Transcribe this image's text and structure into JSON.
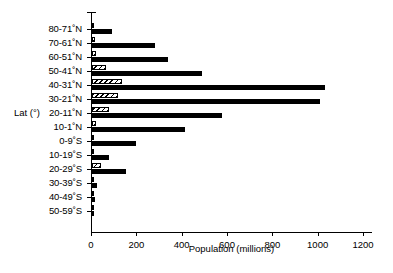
{
  "chart_data": {
    "type": "bar",
    "orientation": "horizontal",
    "title": "",
    "xlabel": "Population (millions)",
    "ylabel": "Lat (°)",
    "xlim": [
      0,
      1200
    ],
    "xticks": [
      0,
      200,
      400,
      600,
      800,
      1000,
      1200
    ],
    "xticklabels": [
      "0",
      "200",
      "400",
      "600",
      "800",
      "1000",
      "1200"
    ],
    "grid": false,
    "legend": "none",
    "categories": [
      "80-71˚N",
      "70-61˚N",
      "60-51˚N",
      "50-41˚N",
      "40-31˚N",
      "30-21˚N",
      "20-11˚N",
      "10-1˚N",
      "0-9˚S",
      "10-19˚S",
      "20-29˚S",
      "30-39˚S",
      "40-49˚S",
      "50-59˚S"
    ],
    "series": [
      {
        "name": "hatched",
        "style": "hatched",
        "values": [
          3,
          14,
          18,
          63,
          132,
          116,
          77,
          17,
          6,
          4,
          39,
          9,
          5,
          2
        ]
      },
      {
        "name": "solid",
        "style": "solid-black",
        "values": [
          89,
          279,
          335,
          485,
          1026,
          1007,
          575,
          410,
          192,
          77,
          149,
          20,
          13,
          1
        ]
      }
    ]
  }
}
